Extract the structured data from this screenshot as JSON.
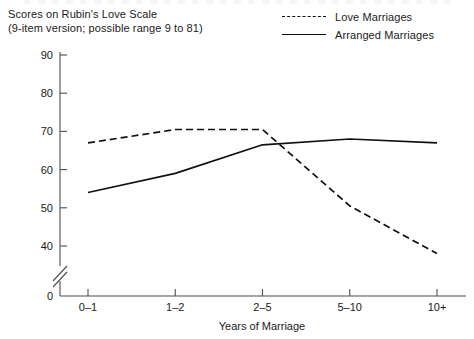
{
  "figure": {
    "title_lines": [
      "Scores on Rubin's Love Scale",
      "(9-item version; possible range 9 to 81)"
    ],
    "background_color": "#ffffff",
    "line_color": "#111111",
    "axis_color": "#4d4d4d"
  },
  "legend": {
    "position": "top-right",
    "entries": [
      {
        "label": "Love Marriages",
        "style": "dashed"
      },
      {
        "label": "Arranged Marriages",
        "style": "solid"
      }
    ]
  },
  "chart_data": {
    "type": "line",
    "title": "Scores on Rubin's Love Scale (9-item version; possible range 9 to 81)",
    "xlabel": "Years of Marriage",
    "ylabel": "",
    "categories": [
      "0–1",
      "1–2",
      "2–5",
      "5–10",
      "10+"
    ],
    "series": [
      {
        "name": "Love Marriages",
        "style": "dashed",
        "values": [
          67,
          70.5,
          70.5,
          50.5,
          38
        ]
      },
      {
        "name": "Arranged Marriages",
        "style": "solid",
        "values": [
          54,
          59,
          66.5,
          68,
          67
        ]
      }
    ],
    "ylim": [
      35,
      90
    ],
    "yticks": [
      40,
      50,
      60,
      70,
      80,
      90
    ],
    "ytick_labels": [
      "40",
      "50",
      "60",
      "70",
      "80",
      "90"
    ],
    "y_origin_label": "0",
    "y_axis_break": true,
    "grid": false,
    "legend_position": "top-right"
  }
}
